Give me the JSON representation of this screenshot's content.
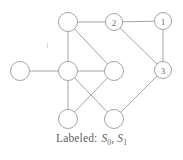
{
  "figure": {
    "name": "labeled-graph-figure",
    "caption": {
      "prefix": "Labeled:",
      "symbol_1_base": "S",
      "symbol_1_sub": "0",
      "separator": ",",
      "symbol_2_base": "S",
      "symbol_2_sub": "1",
      "full_text": "Labeled: S0, S1"
    },
    "colors": {
      "stroke": "#9a9a9a",
      "node_fill": "#ffffff",
      "label_text": "#6d6d6d",
      "caption_text": "#5f5f5f",
      "background": "#ffffff"
    }
  },
  "graph": {
    "node_radius": 9.5,
    "labeled_node_radius": 8.5,
    "nodes": [
      {
        "id": "n-top-left",
        "label": "",
        "x": 68,
        "y": 22,
        "r": 9.5,
        "labeled": false
      },
      {
        "id": "n-two",
        "label": "2",
        "x": 114,
        "y": 22,
        "r": 8.5,
        "labeled": true
      },
      {
        "id": "n-one",
        "label": "1",
        "x": 163,
        "y": 21,
        "r": 8.5,
        "labeled": true
      },
      {
        "id": "n-left",
        "label": "",
        "x": 20,
        "y": 71,
        "r": 9.5,
        "labeled": false
      },
      {
        "id": "n-hub",
        "label": "",
        "x": 68,
        "y": 71,
        "r": 9.5,
        "labeled": false
      },
      {
        "id": "n-mid-right",
        "label": "",
        "x": 114,
        "y": 71,
        "r": 9.5,
        "labeled": false
      },
      {
        "id": "n-three",
        "label": "3",
        "x": 163,
        "y": 70,
        "r": 8.5,
        "labeled": true
      },
      {
        "id": "n-bottom-left",
        "label": "",
        "x": 68,
        "y": 119,
        "r": 9.5,
        "labeled": false
      },
      {
        "id": "n-bottom-right",
        "label": "",
        "x": 114,
        "y": 119,
        "r": 9.5,
        "labeled": false
      }
    ],
    "edges": [
      {
        "id": "e-topleft-two",
        "from": "n-top-left",
        "to": "n-two"
      },
      {
        "id": "e-two-one",
        "from": "n-two",
        "to": "n-one"
      },
      {
        "id": "e-one-three",
        "from": "n-one",
        "to": "n-three"
      },
      {
        "id": "e-two-three",
        "from": "n-two",
        "to": "n-three"
      },
      {
        "id": "e-topleft-hub",
        "from": "n-top-left",
        "to": "n-hub"
      },
      {
        "id": "e-topleft-midright",
        "from": "n-top-left",
        "to": "n-mid-right"
      },
      {
        "id": "e-left-hub",
        "from": "n-left",
        "to": "n-hub"
      },
      {
        "id": "e-hub-midright",
        "from": "n-hub",
        "to": "n-mid-right"
      },
      {
        "id": "e-hub-bottomleft",
        "from": "n-hub",
        "to": "n-bottom-left"
      },
      {
        "id": "e-hub-bottomright",
        "from": "n-hub",
        "to": "n-bottom-right"
      },
      {
        "id": "e-midright-bottomleft",
        "from": "n-mid-right",
        "to": "n-bottom-left"
      },
      {
        "id": "e-three-bottomright",
        "from": "n-three",
        "to": "n-bottom-right"
      }
    ]
  }
}
